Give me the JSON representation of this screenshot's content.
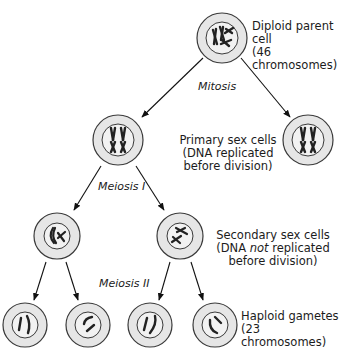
{
  "diagram": {
    "type": "cell-division-flowchart",
    "colors": {
      "cell_fill": "#e6e6e6",
      "nucleus_fill": "#f2f2f2",
      "outline": "#3a3a3a",
      "chromosome": "#2a2a2a",
      "arrow": "#111111"
    }
  },
  "labels": {
    "parent": {
      "line1": "Diploid parent cell",
      "line2": "(46 chromosomes)"
    },
    "primary": {
      "line1": "Primary sex cells",
      "line2": "(DNA replicated",
      "line3": "before division)"
    },
    "secondary": {
      "line1": "Secondary sex cells",
      "line2_pre": "(DNA ",
      "line2_em": "not",
      "line2_post": " replicated",
      "line3": "before division)"
    },
    "gametes": {
      "line1": "Haploid gametes",
      "line2": "(23 chromosomes)"
    }
  },
  "stages": {
    "mitosis": "Mitosis",
    "meiosis1": "Meiosis I",
    "meiosis2": "Meiosis II"
  },
  "cells": [
    {
      "id": "parent",
      "cx": 222,
      "cy": 38,
      "r": 25,
      "level": 0
    },
    {
      "id": "primary-left",
      "cx": 118,
      "cy": 140,
      "r": 25,
      "level": 1
    },
    {
      "id": "primary-right",
      "cx": 308,
      "cy": 140,
      "r": 25,
      "level": 1
    },
    {
      "id": "secondary-left",
      "cx": 57,
      "cy": 236,
      "r": 23,
      "level": 2
    },
    {
      "id": "secondary-right",
      "cx": 180,
      "cy": 236,
      "r": 23,
      "level": 2
    },
    {
      "id": "gamete-1",
      "cx": 25,
      "cy": 325,
      "r": 22,
      "level": 3
    },
    {
      "id": "gamete-2",
      "cx": 88,
      "cy": 325,
      "r": 22,
      "level": 3
    },
    {
      "id": "gamete-3",
      "cx": 150,
      "cy": 325,
      "r": 22,
      "level": 3
    },
    {
      "id": "gamete-4",
      "cx": 215,
      "cy": 325,
      "r": 22,
      "level": 3
    }
  ]
}
